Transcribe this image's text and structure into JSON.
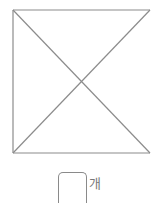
{
  "figure": {
    "shape": "square with both diagonals drawn, right side open",
    "line_color": "#8c8c8c",
    "lines": [
      {
        "name": "top-edge",
        "x1": 13,
        "y1": 10,
        "x2": 150,
        "y2": 10
      },
      {
        "name": "left-edge",
        "x1": 13,
        "y1": 10,
        "x2": 13,
        "y2": 153
      },
      {
        "name": "bottom-edge",
        "x1": 13,
        "y1": 153,
        "x2": 150,
        "y2": 153
      },
      {
        "name": "diagonal-down",
        "x1": 13,
        "y1": 10,
        "x2": 150,
        "y2": 153
      },
      {
        "name": "diagonal-up",
        "x1": 150,
        "y1": 10,
        "x2": 13,
        "y2": 153
      }
    ]
  },
  "answer": {
    "value": "",
    "unit": "개"
  }
}
